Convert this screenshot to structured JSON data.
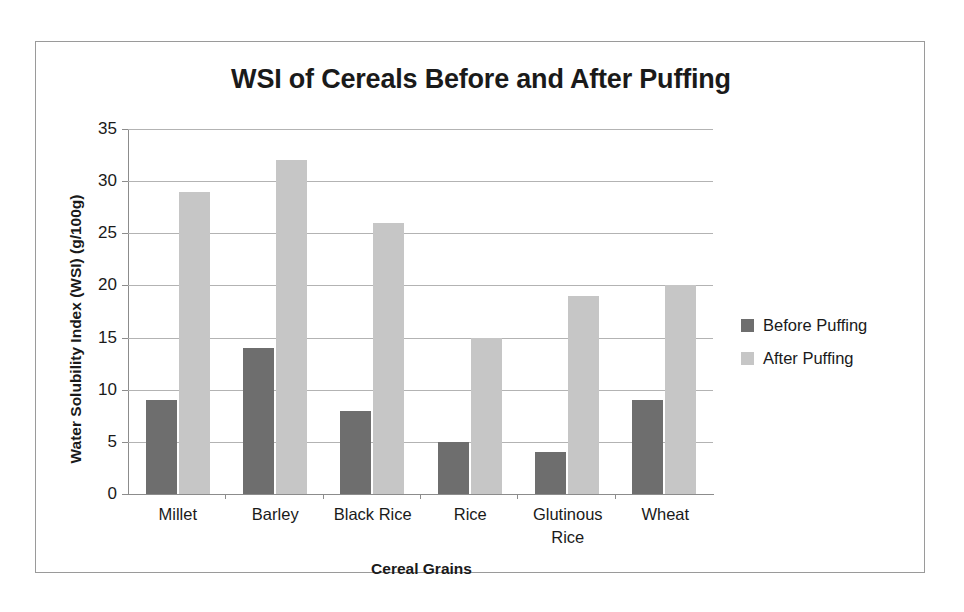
{
  "chart_data": {
    "type": "bar",
    "title": "WSI of Cereals Before and After Puffing",
    "xlabel": "Cereal  Grains",
    "ylabel": "Water Solubility Index (WSI) (g/100g)",
    "categories": [
      "Millet",
      "Barley",
      "Black Rice",
      "Rice",
      "Glutinous Rice",
      "Wheat"
    ],
    "category_lines": [
      [
        "Millet"
      ],
      [
        "Barley"
      ],
      [
        "Black Rice"
      ],
      [
        "Rice"
      ],
      [
        "Glutinous",
        "Rice"
      ],
      [
        "Wheat"
      ]
    ],
    "series": [
      {
        "name": "Before  Puffing",
        "color": "#6e6e6e",
        "values": [
          9,
          14,
          8,
          5,
          4,
          9
        ]
      },
      {
        "name": "After  Puffing",
        "color": "#c6c6c6",
        "values": [
          29,
          32,
          26,
          15,
          19,
          20
        ]
      }
    ],
    "ylim": [
      0,
      35
    ],
    "yticks": [
      0,
      5,
      10,
      15,
      20,
      25,
      30,
      35
    ],
    "ytick_labels": [
      "0",
      "5",
      "10",
      "15",
      "20",
      "25",
      "30",
      "35"
    ],
    "grid": true,
    "legend_position": "right"
  }
}
